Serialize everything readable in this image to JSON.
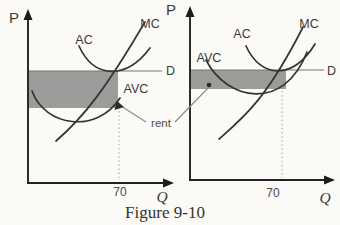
{
  "figure": {
    "caption": "Figure 9-10",
    "rent_annotation": "rent"
  },
  "colors": {
    "background": "#fbfaf7",
    "shade": "#9c9c9a",
    "curve": "#343432",
    "axis": "#222220",
    "demand_line": "#77756f",
    "dotted_guide": "#aaa8a2",
    "label_text": "#3a3a38"
  },
  "left_graph": {
    "price_axis_label": "P",
    "quantity_axis_label": "Q",
    "average_cost_label": "AC",
    "marginal_cost_label": "MC",
    "average_variable_cost_label": "AVC",
    "demand_label": "D",
    "quantity_tick": "70"
  },
  "right_graph": {
    "price_axis_label": "P",
    "quantity_axis_label": "Q",
    "average_cost_label": "AC",
    "marginal_cost_label": "MC",
    "average_variable_cost_label": "AVC",
    "demand_label": "D",
    "quantity_tick": "70"
  }
}
